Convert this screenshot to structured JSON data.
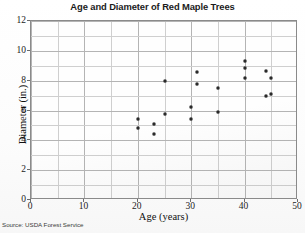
{
  "chart_data": {
    "type": "scatter",
    "title": "Age and Diameter of Red Maple Trees",
    "xlabel": "Age (years)",
    "ylabel": "Diameter (in.)",
    "xlim": [
      0,
      50
    ],
    "ylim": [
      0,
      12
    ],
    "xticks": [
      0,
      10,
      20,
      30,
      40,
      50
    ],
    "yticks": [
      0,
      2,
      4,
      6,
      8,
      10,
      12
    ],
    "x_minor_step": 5,
    "y_minor_step": 1,
    "grid": true,
    "legend": null,
    "marker": "filled-circle",
    "marker_color": "#2a2a2a",
    "points": [
      {
        "x": 20,
        "y": 5.45
      },
      {
        "x": 20,
        "y": 4.85
      },
      {
        "x": 23,
        "y": 5.1
      },
      {
        "x": 23,
        "y": 4.45
      },
      {
        "x": 25,
        "y": 8.0
      },
      {
        "x": 25,
        "y": 5.75
      },
      {
        "x": 30,
        "y": 6.25
      },
      {
        "x": 30,
        "y": 5.4
      },
      {
        "x": 31,
        "y": 8.55
      },
      {
        "x": 31,
        "y": 7.8
      },
      {
        "x": 35,
        "y": 7.5
      },
      {
        "x": 35,
        "y": 5.9
      },
      {
        "x": 40,
        "y": 9.3
      },
      {
        "x": 40,
        "y": 8.85
      },
      {
        "x": 40,
        "y": 8.2
      },
      {
        "x": 44,
        "y": 8.65
      },
      {
        "x": 44,
        "y": 7.0
      },
      {
        "x": 45,
        "y": 8.2
      },
      {
        "x": 45,
        "y": 7.1
      },
      {
        "x": 50,
        "y": 10.9
      },
      {
        "x": 50,
        "y": 5.75
      }
    ]
  },
  "source": {
    "text": "Source: USDA Forest Service"
  },
  "colors": {
    "marker": "#2a2a2a",
    "frame": "#8a8a8a",
    "grid_major": "#b4b4b4",
    "grid_minor": "#cfcfcf",
    "text": "#1b1b1b"
  }
}
